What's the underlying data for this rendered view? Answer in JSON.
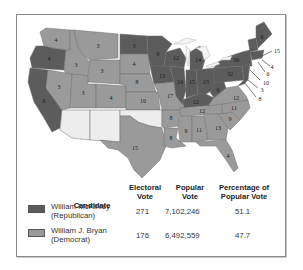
{
  "map": {
    "title": "Election of 1896",
    "colors": {
      "republican": "#5c5c5c",
      "democrat": "#9a9a9a",
      "territory": "#ededed"
    },
    "states": [
      {
        "abbr": "WA",
        "votes": "4",
        "party": "democrat"
      },
      {
        "abbr": "OR",
        "votes": "4",
        "party": "republican"
      },
      {
        "abbr": "CA",
        "votes": "8",
        "party": "republican"
      },
      {
        "abbr": "ID",
        "votes": "3",
        "party": "democrat"
      },
      {
        "abbr": "NV",
        "votes": "3",
        "party": "democrat"
      },
      {
        "abbr": "MT",
        "votes": "3",
        "party": "democrat"
      },
      {
        "abbr": "WY",
        "votes": "3",
        "party": "democrat"
      },
      {
        "abbr": "UT",
        "votes": "3",
        "party": "democrat"
      },
      {
        "abbr": "CO",
        "votes": "4",
        "party": "democrat"
      },
      {
        "abbr": "ND",
        "votes": "3",
        "party": "republican"
      },
      {
        "abbr": "SD",
        "votes": "4",
        "party": "democrat"
      },
      {
        "abbr": "NE",
        "votes": "8",
        "party": "democrat"
      },
      {
        "abbr": "KS",
        "votes": "10",
        "party": "democrat"
      },
      {
        "abbr": "TX",
        "votes": "15",
        "party": "democrat"
      },
      {
        "abbr": "MN",
        "votes": "9",
        "party": "republican"
      },
      {
        "abbr": "IA",
        "votes": "13",
        "party": "republican"
      },
      {
        "abbr": "MO",
        "votes": "17",
        "party": "democrat"
      },
      {
        "abbr": "AR",
        "votes": "8",
        "party": "democrat"
      },
      {
        "abbr": "LA",
        "votes": "8",
        "party": "democrat"
      },
      {
        "abbr": "WI",
        "votes": "12",
        "party": "republican"
      },
      {
        "abbr": "IL",
        "votes": "24",
        "party": "republican"
      },
      {
        "abbr": "MI",
        "votes": "14",
        "party": "republican"
      },
      {
        "abbr": "IN",
        "votes": "15",
        "party": "republican"
      },
      {
        "abbr": "OH",
        "votes": "23",
        "party": "republican"
      },
      {
        "abbr": "KY",
        "votes": "12",
        "party": "republican"
      },
      {
        "abbr": "TN",
        "votes": "12",
        "party": "democrat"
      },
      {
        "abbr": "MS",
        "votes": "9",
        "party": "democrat"
      },
      {
        "abbr": "AL",
        "votes": "11",
        "party": "democrat"
      },
      {
        "abbr": "GA",
        "votes": "13",
        "party": "democrat"
      },
      {
        "abbr": "FL",
        "votes": "4",
        "party": "democrat"
      },
      {
        "abbr": "SC",
        "votes": "9",
        "party": "democrat"
      },
      {
        "abbr": "NC",
        "votes": "11",
        "party": "democrat"
      },
      {
        "abbr": "VA",
        "votes": "12",
        "party": "democrat"
      },
      {
        "abbr": "WV",
        "votes": "6",
        "party": "republican"
      },
      {
        "abbr": "PA",
        "votes": "32",
        "party": "republican"
      },
      {
        "abbr": "NY",
        "votes": "36",
        "party": "republican"
      },
      {
        "abbr": "VT",
        "votes": "4",
        "party": "republican"
      },
      {
        "abbr": "NH",
        "votes": "4",
        "party": "republican"
      },
      {
        "abbr": "ME",
        "votes": "6",
        "party": "republican"
      },
      {
        "abbr": "MA",
        "votes": "15",
        "party": "republican"
      },
      {
        "abbr": "RI",
        "votes": "4",
        "party": "republican"
      },
      {
        "abbr": "CT",
        "votes": "6",
        "party": "republican"
      },
      {
        "abbr": "NJ",
        "votes": "10",
        "party": "republican"
      },
      {
        "abbr": "DE",
        "votes": "3",
        "party": "republican"
      },
      {
        "abbr": "MD",
        "votes": "8",
        "party": "republican"
      },
      {
        "abbr": "AZ",
        "votes": "",
        "party": "territory"
      },
      {
        "abbr": "NM",
        "votes": "",
        "party": "territory"
      },
      {
        "abbr": "OK",
        "votes": "",
        "party": "territory"
      }
    ],
    "east_callouts": [
      "15",
      "4",
      "6",
      "10",
      "3",
      "8"
    ]
  },
  "legend": {
    "headers": {
      "candidate": "Candidate",
      "electoral_1": "Electoral",
      "electoral_2": "Vote",
      "popular_1": "Popular",
      "popular_2": "Vote",
      "percent_1": "Percentage of",
      "percent_2": "Popular Vote"
    },
    "rows": [
      {
        "name": "William McKinley",
        "party": "(Republican)",
        "electoral": "271",
        "popular": "7,102,246",
        "percent": "51.1",
        "swatch": "#5c5c5c"
      },
      {
        "name": "William J. Bryan",
        "party": "(Democrat)",
        "electoral": "176",
        "popular": "6,492,559",
        "percent": "47.7",
        "swatch": "#9a9a9a"
      }
    ]
  }
}
